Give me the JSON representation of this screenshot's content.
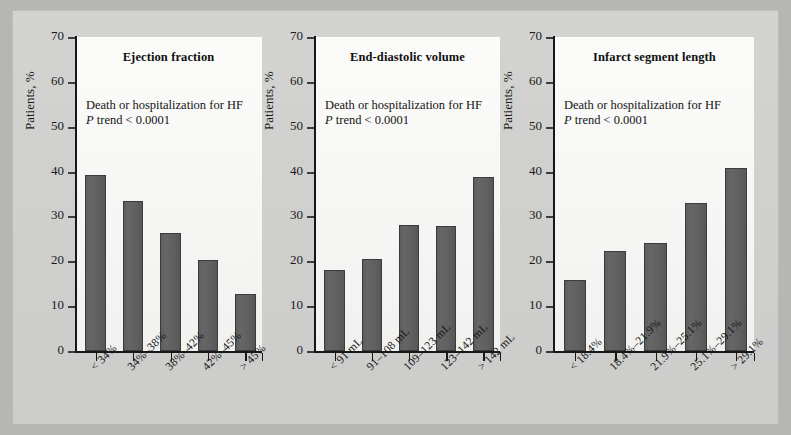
{
  "figure": {
    "background_color": "#cfcfcd",
    "bar_color": "#5f5f5f",
    "axis_color": "#17171a",
    "y_axis_title": "Patients, %",
    "y_ticks": [
      0,
      10,
      20,
      30,
      40,
      50,
      60,
      70
    ],
    "note_line1": "Death or hospitalization for HF",
    "note_line2_italic": "P",
    "note_line2_rest": " trend < 0.0001"
  },
  "chart_data": [
    {
      "type": "bar",
      "title": "Ejection fraction",
      "xlabel": "",
      "ylabel": "Patients, %",
      "ylim": [
        0,
        70
      ],
      "yticks": [
        0,
        10,
        20,
        30,
        40,
        50,
        60,
        70
      ],
      "grid": false,
      "legend": "none",
      "annotations": [
        "Death or hospitalization for HF",
        "P trend < 0.0001"
      ],
      "categories": [
        "< 34%",
        "34%–38%",
        "38%–42%",
        "42%–45%",
        "> 45%"
      ],
      "values": [
        39.3,
        33.5,
        26.2,
        20.3,
        12.6
      ]
    },
    {
      "type": "bar",
      "title": "End-diastolic volume",
      "xlabel": "",
      "ylabel": "Patients, %",
      "ylim": [
        0,
        70
      ],
      "yticks": [
        0,
        10,
        20,
        30,
        40,
        50,
        60,
        70
      ],
      "grid": false,
      "legend": "none",
      "annotations": [
        "Death or hospitalization for HF",
        "P trend < 0.0001"
      ],
      "categories": [
        "< 91 mL",
        "91–108 mL",
        "109–123 mL",
        "123–142 mL",
        "> 142 mL"
      ],
      "values": [
        18.0,
        20.6,
        28.2,
        27.9,
        38.9
      ]
    },
    {
      "type": "bar",
      "title": "Infarct segment length",
      "xlabel": "",
      "ylabel": "Patients, %",
      "ylim": [
        0,
        70
      ],
      "yticks": [
        0,
        10,
        20,
        30,
        40,
        50,
        60,
        70
      ],
      "grid": false,
      "legend": "none",
      "annotations": [
        "Death or hospitalization for HF",
        "P trend < 0.0001"
      ],
      "categories": [
        "< 18.4%",
        "18.4%–21.9%",
        "21.9%–25.1%",
        "25.1%–29.1%",
        "> 29.1%"
      ],
      "values": [
        15.9,
        22.2,
        24.0,
        32.9,
        40.8
      ]
    }
  ]
}
